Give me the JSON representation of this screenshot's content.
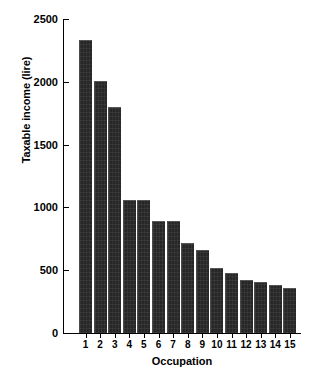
{
  "chart_data": {
    "type": "bar",
    "title": "",
    "xlabel": "Occupation",
    "ylabel": "Taxable income (lire)",
    "categories": [
      "1",
      "2",
      "3",
      "4",
      "5",
      "6",
      "7",
      "8",
      "9",
      "10",
      "11",
      "12",
      "13",
      "14",
      "15"
    ],
    "values": [
      2330,
      2010,
      1800,
      1060,
      1060,
      890,
      890,
      720,
      660,
      520,
      480,
      420,
      410,
      380,
      360
    ],
    "ylim": [
      0,
      2500
    ],
    "yticks": [
      0,
      500,
      1000,
      1500,
      2000,
      2500
    ],
    "ytick_labels": [
      "0",
      "500",
      "1000",
      "1500",
      "2000",
      "2500"
    ],
    "grid": false,
    "legend": null,
    "bar_color": "#272727",
    "axis_color": "#000000",
    "background": "#ffffff"
  }
}
